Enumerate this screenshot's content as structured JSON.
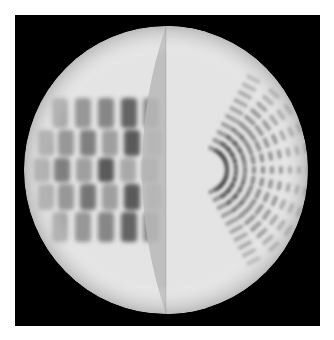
{
  "figure": {
    "background": "#ffffff",
    "frame": {
      "x": 15,
      "y": 15,
      "width": 305,
      "height": 311,
      "color": "#000000"
    },
    "sphere": {
      "cx": 166,
      "cy": 170,
      "rx": 142,
      "ry": 144,
      "base_color": "#e4e4e4",
      "rim_color": "#d6d6d6"
    },
    "band": {
      "seam_x": 166,
      "inner_rx": 24,
      "color": "#b9b9b9",
      "seam_color": "#a8a8a8"
    },
    "left_pattern": {
      "rows": [
        {
          "y": 98,
          "h": 30,
          "cells": [
            [
              52,
              0.35
            ],
            [
              75,
              0.45
            ],
            [
              98,
              0.55
            ],
            [
              121,
              0.75
            ],
            [
              143,
              0.5
            ]
          ]
        },
        {
          "y": 130,
          "h": 26,
          "cells": [
            [
              38,
              0.35
            ],
            [
              58,
              0.45
            ],
            [
              80,
              0.6
            ],
            [
              102,
              0.4
            ],
            [
              124,
              0.8
            ],
            [
              146,
              0.35
            ]
          ]
        },
        {
          "y": 158,
          "h": 24,
          "cells": [
            [
              34,
              0.35
            ],
            [
              54,
              0.6
            ],
            [
              76,
              0.4
            ],
            [
              98,
              0.8
            ],
            [
              120,
              0.35
            ],
            [
              142,
              0.45
            ]
          ]
        },
        {
          "y": 184,
          "h": 26,
          "cells": [
            [
              38,
              0.35
            ],
            [
              58,
              0.45
            ],
            [
              80,
              0.65
            ],
            [
              102,
              0.4
            ],
            [
              124,
              0.8
            ],
            [
              146,
              0.35
            ]
          ]
        },
        {
          "y": 212,
          "h": 30,
          "cells": [
            [
              52,
              0.35
            ],
            [
              75,
              0.45
            ],
            [
              98,
              0.55
            ],
            [
              121,
              0.75
            ],
            [
              143,
              0.5
            ]
          ]
        }
      ],
      "cell_color": "#3a3a3a",
      "grid_color": "#f2f2f2"
    },
    "right_pattern": {
      "origin": {
        "x": 205,
        "y": 170
      },
      "rays": [
        -62,
        -48,
        -36,
        -24,
        -12,
        0,
        12,
        24,
        36,
        48,
        62
      ],
      "ring_start": 22,
      "ring_step": 9,
      "ring_count": 10,
      "dash_color": "#3a3a3a"
    }
  }
}
